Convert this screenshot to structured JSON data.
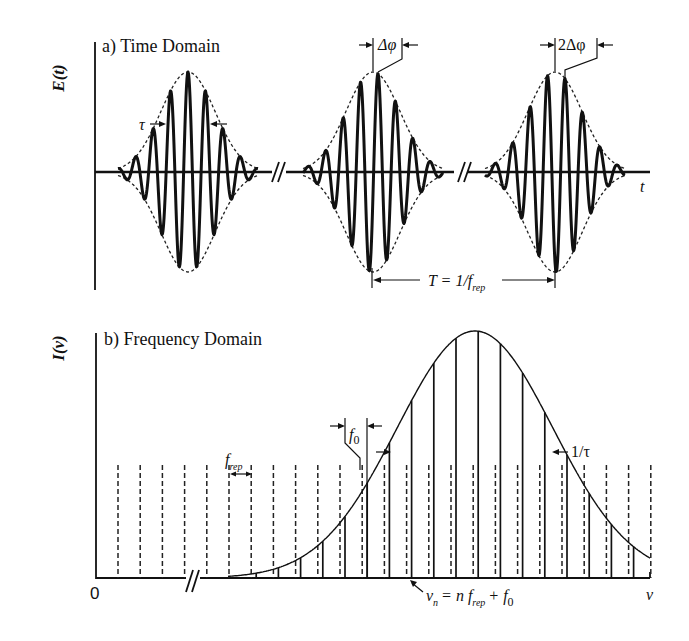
{
  "figure": {
    "panel_a": {
      "title": "a) Time Domain",
      "ylabel": "E(t)",
      "xlabel": "t",
      "pulse_width_label": "τ",
      "phase_shift_1_label": "Δφ",
      "phase_shift_2_label": "2Δφ",
      "period_label_main": "T = 1/f",
      "period_label_sub": "rep",
      "axis_break": "//",
      "pulses": [
        {
          "envelope_center_x": 188,
          "carrier_offset": 0
        },
        {
          "envelope_center_x": 373,
          "carrier_offset": 5
        },
        {
          "envelope_center_x": 555,
          "carrier_offset": 10
        }
      ]
    },
    "panel_b": {
      "title": "b) Frequency Domain",
      "ylabel": "I(ν)",
      "xlabel": "ν",
      "origin_label": "0",
      "rep_rate_label_main": "f",
      "rep_rate_label_sub": "rep",
      "offset_label_main": "f",
      "offset_label_sub": "0",
      "bandwidth_label": "1/τ",
      "mode_eq_nu": "ν",
      "mode_eq_n_sub": "n",
      "mode_eq_rest": "= n f",
      "mode_eq_rep_sub": "rep",
      "mode_eq_plus": "+ f",
      "mode_eq_zero_sub": "0",
      "axis_break": "//",
      "comb": {
        "first_x": 118,
        "spacing": 22.2,
        "count": 25,
        "offset_px": 5,
        "dashed_height_top": 465,
        "baseline": 578
      },
      "envelope": {
        "peak_x": 475,
        "peak_y": 331,
        "sigma_px": 78,
        "start_x": 228,
        "end_x": 650
      }
    }
  }
}
